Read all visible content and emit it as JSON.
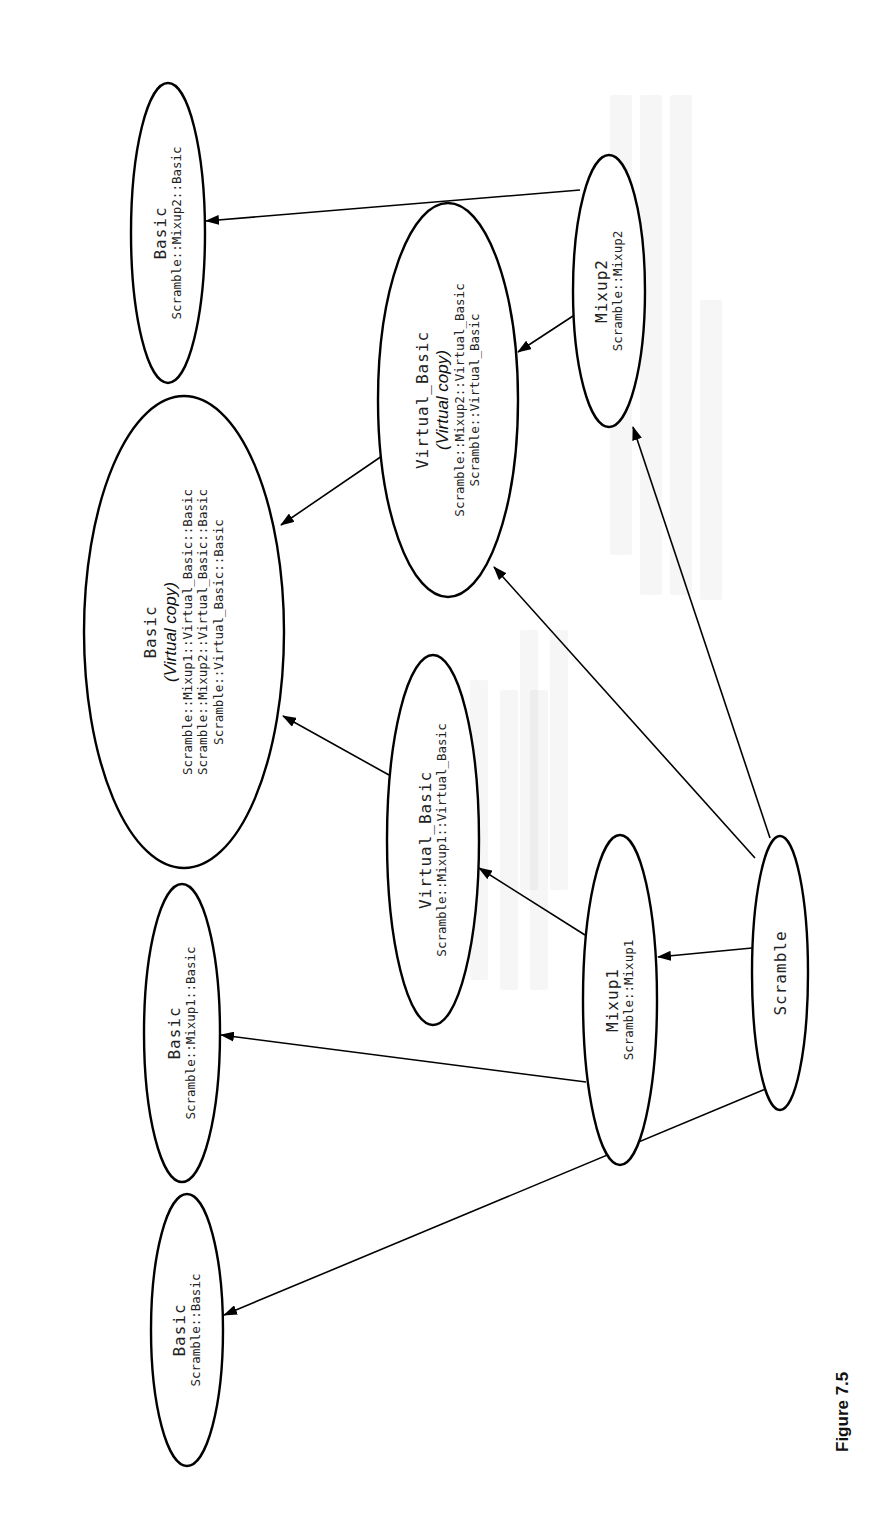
{
  "figure": {
    "caption": "Figure 7.5",
    "orientation": "rotated-90-ccw"
  },
  "nodes": [
    {
      "id": "basic_mixup2",
      "title": "Basic",
      "virtual_label": "",
      "lines": [
        "Scramble::Mixup2::Basic"
      ],
      "cx": 168,
      "cy": 233,
      "rx": 37,
      "ry": 150
    },
    {
      "id": "basic_virtual",
      "title": "Basic",
      "virtual_label": "(Virtual copy)",
      "lines": [
        "Scramble::Mixup1::Virtual_Basic::Basic",
        "Scramble::Mixup2::Virtual_Basic::Basic",
        "Scramble::Virtual_Basic::Basic"
      ],
      "cx": 184,
      "cy": 632,
      "rx": 100,
      "ry": 236
    },
    {
      "id": "virtual_basic_virtual",
      "title": "Virtual_Basic",
      "virtual_label": "(Virtual copy)",
      "lines": [
        "Scramble::Mixup2::Virtual_Basic",
        "Scramble::Virtual_Basic"
      ],
      "cx": 448,
      "cy": 400,
      "rx": 70,
      "ry": 197
    },
    {
      "id": "mixup2",
      "title": "Mixup2",
      "virtual_label": "",
      "lines": [
        "Scramble::Mixup2"
      ],
      "cx": 609,
      "cy": 291,
      "rx": 36,
      "ry": 136
    },
    {
      "id": "virtual_basic_mixup1",
      "title": "Virtual_Basic",
      "virtual_label": "",
      "lines": [
        "Scramble::Mixup1::Virtual_Basic"
      ],
      "cx": 433,
      "cy": 840,
      "rx": 46,
      "ry": 185
    },
    {
      "id": "basic_mixup1",
      "title": "Basic",
      "virtual_label": "",
      "lines": [
        "Scramble::Mixup1::Basic"
      ],
      "cx": 182,
      "cy": 1033,
      "rx": 38,
      "ry": 149
    },
    {
      "id": "mixup1",
      "title": "Mixup1",
      "virtual_label": "",
      "lines": [
        "Scramble::Mixup1"
      ],
      "cx": 620,
      "cy": 1000,
      "rx": 37,
      "ry": 165
    },
    {
      "id": "scramble",
      "title": "Scramble",
      "virtual_label": "",
      "lines": [],
      "cx": 780,
      "cy": 973,
      "rx": 28,
      "ry": 137
    },
    {
      "id": "basic_scramble",
      "title": "Basic",
      "virtual_label": "",
      "lines": [
        "Scramble::Basic"
      ],
      "cx": 187,
      "cy": 1330,
      "rx": 36,
      "ry": 136
    }
  ],
  "edges": [
    {
      "from": "mixup2",
      "to": "basic_mixup2",
      "x1": 580,
      "y1": 190,
      "x2": 206,
      "y2": 221
    },
    {
      "from": "mixup2",
      "to": "virtual_basic_virtual",
      "x1": 573,
      "y1": 316,
      "x2": 518,
      "y2": 352
    },
    {
      "from": "virtual_basic_virtual",
      "to": "basic_virtual",
      "x1": 382,
      "y1": 456,
      "x2": 281,
      "y2": 525
    },
    {
      "from": "virtual_basic_mixup1",
      "to": "basic_virtual",
      "x1": 389,
      "y1": 775,
      "x2": 283,
      "y2": 716
    },
    {
      "from": "mixup1",
      "to": "virtual_basic_mixup1",
      "x1": 585,
      "y1": 935,
      "x2": 479,
      "y2": 868
    },
    {
      "from": "mixup1",
      "to": "basic_mixup1",
      "x1": 586,
      "y1": 1082,
      "x2": 221,
      "y2": 1035
    },
    {
      "from": "scramble",
      "to": "mixup1",
      "x1": 752,
      "y1": 948,
      "x2": 658,
      "y2": 957
    },
    {
      "from": "scramble",
      "to": "virtual_basic_virtual",
      "x1": 755,
      "y1": 858,
      "x2": 494,
      "y2": 567
    },
    {
      "from": "scramble",
      "to": "mixup2",
      "x1": 770,
      "y1": 838,
      "x2": 633,
      "y2": 427
    },
    {
      "from": "scramble",
      "to": "basic_scramble",
      "x1": 768,
      "y1": 1088,
      "x2": 224,
      "y2": 1315
    }
  ],
  "colors": {
    "stroke": "#000000",
    "background": "#ffffff",
    "text": "#222222"
  }
}
